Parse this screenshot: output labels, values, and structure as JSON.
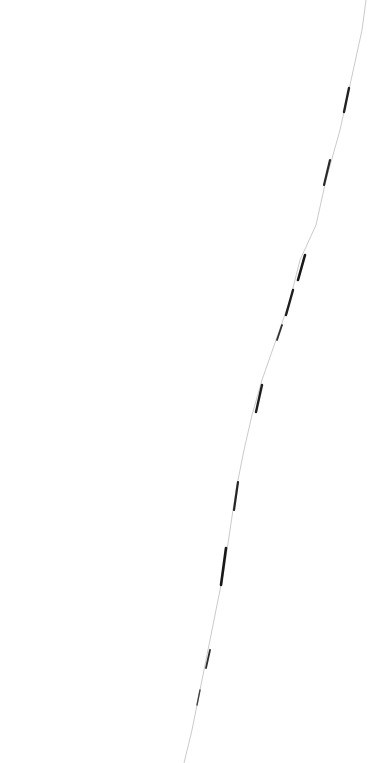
{
  "image": {
    "background_color": "#ffffff",
    "stroke_color": "#1a1a1a",
    "description": "thin dark diagonal crack line on white background"
  }
}
